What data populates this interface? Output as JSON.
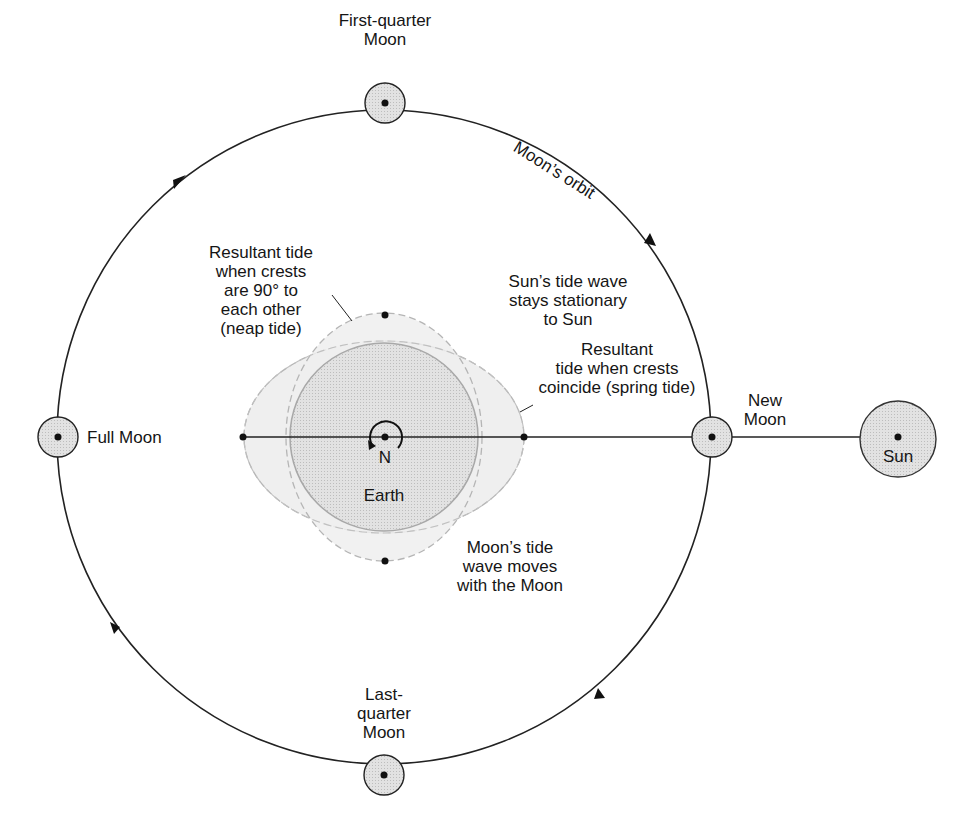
{
  "diagram": {
    "colors": {
      "line": "#222222",
      "body_fill": "#d6d6d6",
      "tide_fill": "#ececec",
      "dash": "#b0b0b0",
      "sun_fill": "#cfcfcf"
    }
  },
  "labels": {
    "first_quarter": "First-quarter\nMoon",
    "moons_orbit": "Moon’s orbit",
    "full_moon": "Full Moon",
    "new_moon": "New\nMoon",
    "sun": "Sun",
    "last_quarter": "Last-\nquarter\nMoon",
    "earth": "Earth",
    "north": "N",
    "neap_tide": "Resultant tide\nwhen crests\nare 90° to\neach other\n(neap tide)",
    "sun_tide": "Sun’s tide wave\nstays stationary\nto Sun",
    "spring_tide": "Resultant\ntide when crests\ncoincide (spring tide)",
    "moon_tide": "Moon’s tide\nwave moves\nwith the Moon"
  }
}
